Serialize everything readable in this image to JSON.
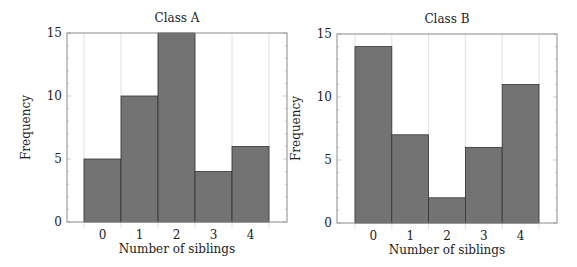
{
  "chart_data": [
    {
      "type": "bar",
      "title": "Class A",
      "xlabel": "Number of siblings",
      "ylabel": "Frequency",
      "categories": [
        "0",
        "1",
        "2",
        "3",
        "4"
      ],
      "values": [
        5,
        10,
        15,
        4,
        6
      ],
      "ylim": [
        0,
        15
      ],
      "yticks": [
        "0",
        "5",
        "10",
        "15"
      ],
      "grid": "vertical",
      "legend": null,
      "bar_color": "#737373",
      "edge_color": "#333333"
    },
    {
      "type": "bar",
      "title": "Class B",
      "xlabel": "Number of siblings",
      "ylabel": "Frequency",
      "categories": [
        "0",
        "1",
        "2",
        "3",
        "4"
      ],
      "values": [
        14,
        7,
        2,
        6,
        11
      ],
      "ylim": [
        0,
        15
      ],
      "yticks": [
        "0",
        "5",
        "10",
        "15"
      ],
      "grid": "vertical",
      "legend": null,
      "bar_color": "#737373",
      "edge_color": "#333333"
    }
  ]
}
